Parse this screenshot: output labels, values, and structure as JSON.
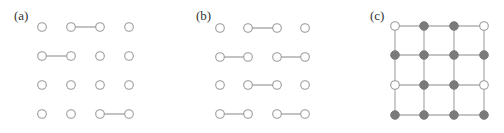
{
  "figure": {
    "panels": [
      {
        "label": "(a)",
        "label_pos": [
          14,
          20
        ],
        "xs": [
          42,
          71,
          100,
          129
        ],
        "ys": [
          27,
          56,
          85,
          114
        ],
        "node_style": "open",
        "edges": [
          [
            [
              1,
              0
            ],
            [
              2,
              0
            ]
          ],
          [
            [
              0,
              1
            ],
            [
              1,
              1
            ]
          ],
          [
            [
              2,
              3
            ],
            [
              3,
              3
            ]
          ]
        ]
      },
      {
        "label": "(b)",
        "label_pos": [
          196,
          20
        ],
        "xs": [
          220,
          248,
          277,
          305
        ],
        "ys": [
          28,
          57,
          85,
          114
        ],
        "node_style": "open",
        "edges": [
          [
            [
              1,
              0
            ],
            [
              2,
              0
            ]
          ],
          [
            [
              0,
              1
            ],
            [
              1,
              1
            ]
          ],
          [
            [
              2,
              1
            ],
            [
              3,
              1
            ]
          ],
          [
            [
              1,
              2
            ],
            [
              2,
              2
            ]
          ],
          [
            [
              0,
              3
            ],
            [
              1,
              3
            ]
          ],
          [
            [
              2,
              3
            ],
            [
              3,
              3
            ]
          ]
        ]
      },
      {
        "label": "(c)",
        "label_pos": [
          370,
          20
        ],
        "xs": [
          395,
          424,
          454,
          484
        ],
        "ys": [
          26,
          55,
          85,
          115
        ],
        "node_style": "mixed",
        "full_grid": true,
        "open_nodes": [
          [
            0,
            0
          ],
          [
            3,
            0
          ],
          [
            0,
            2
          ],
          [
            3,
            2
          ]
        ],
        "colors": {
          "filled": "#7a7a7a",
          "open": "#ffffff",
          "edge": "#b0b0b0"
        }
      }
    ]
  }
}
